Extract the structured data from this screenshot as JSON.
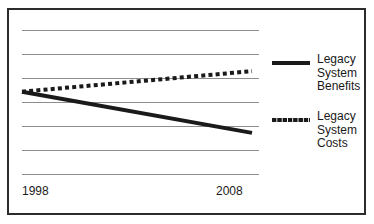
{
  "chart_data": {
    "type": "line",
    "title": "",
    "xlabel": "",
    "ylabel": "",
    "grid": true,
    "gridlines": 7,
    "legend_position": "right",
    "x": [
      1998,
      2008
    ],
    "xlim": [
      1998,
      2008
    ],
    "ylim": [
      0,
      7
    ],
    "xticklabels": [
      "1998",
      "2008"
    ],
    "yticklabels": [],
    "series": [
      {
        "name": "Legacy System Benefits",
        "style": "solid",
        "color": "#1a1a1a",
        "values": [
          4,
          2
        ]
      },
      {
        "name": "Legacy System Costs",
        "style": "dotted",
        "color": "#1a1a1a",
        "values": [
          4,
          5
        ]
      }
    ]
  },
  "axis": {
    "x_tick_left": "1998",
    "x_tick_right": "2008"
  },
  "legend": {
    "items": [
      {
        "swatch": "solid-line-swatch",
        "line1": "Legacy",
        "line2": "System",
        "line3": "Benefits"
      },
      {
        "swatch": "dotted-line-swatch",
        "line1": "Legacy",
        "line2": "System",
        "line3": "Costs"
      }
    ]
  },
  "colors": {
    "frame": "#2c2c2c",
    "gridline": "#8d8d8d",
    "series": "#1a1a1a",
    "background": "#ffffff"
  }
}
